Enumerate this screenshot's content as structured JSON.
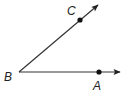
{
  "diagram": {
    "type": "angle",
    "name": "angle ABC",
    "vertex": {
      "label": "B",
      "x": 19,
      "y": 72
    },
    "points": [
      {
        "label": "A",
        "x": 99,
        "y": 72
      },
      {
        "label": "C",
        "x": 80,
        "y": 20
      }
    ],
    "rays": [
      {
        "from": "B",
        "through": "A",
        "tip": {
          "x": 121,
          "y": 72
        }
      },
      {
        "from": "B",
        "through": "C",
        "tip": {
          "x": 99,
          "y": 4
        }
      }
    ],
    "labels": {
      "A": "A",
      "B": "B",
      "C": "C"
    },
    "colors": {
      "stroke": "#333333",
      "point": "#111111"
    }
  }
}
